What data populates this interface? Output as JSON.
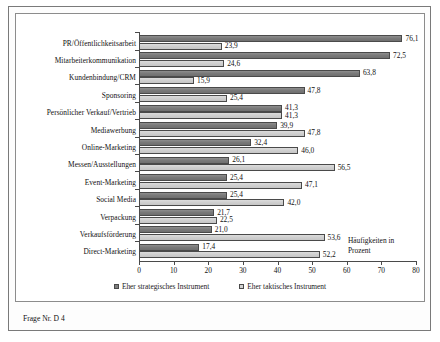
{
  "caption": "Frage Nr. D 4",
  "chart_data": {
    "type": "bar",
    "orientation": "horizontal",
    "title": "",
    "subtitle": "",
    "xlabel": "Häufigkeiten in Prozent",
    "ylabel": "",
    "xlim": [
      0,
      80
    ],
    "xticks": [
      0,
      10,
      20,
      30,
      40,
      50,
      60,
      70,
      80
    ],
    "xticklabels": [
      "0",
      "10",
      "20",
      "30",
      "40",
      "50",
      "60",
      "70",
      "80"
    ],
    "grid": false,
    "legend_position": "bottom-center",
    "value_label_decimal_separator": ",",
    "categories": [
      "PR/Öffentlichkeitsarbeit",
      "Mitarbeiterkommunikation",
      "Kundenbindung/CRM",
      "Sponsoring",
      "Persönlicher Verkauf/Vertrieb",
      "Mediawerbung",
      "Online-Marketing",
      "Messen/Ausstellungen",
      "Event-Marketing",
      "Social Media",
      "Verpackung",
      "Verkaufsförderung",
      "Direct-Marketing"
    ],
    "series": [
      {
        "name": "Eher strategisches Instrument",
        "color": "#7f7f7f",
        "values": [
          76.1,
          72.5,
          63.8,
          47.8,
          41.3,
          39.9,
          32.4,
          26.1,
          25.4,
          25.4,
          21.7,
          21.0,
          17.4
        ],
        "labels": [
          "76,1",
          "72,5",
          "63,8",
          "47,8",
          "41,3",
          "39,9",
          "32,4",
          "26,1",
          "25,4",
          "25,4",
          "21,7",
          "21,0",
          "17,4"
        ]
      },
      {
        "name": "Eher taktisches Instrument",
        "color": "#d2d2d2",
        "values": [
          23.9,
          24.6,
          15.9,
          25.4,
          41.3,
          47.8,
          46.0,
          56.5,
          47.1,
          42.0,
          22.5,
          53.6,
          52.2
        ],
        "labels": [
          "23,9",
          "24,6",
          "15,9",
          "25,4",
          "41,3",
          "47,8",
          "46,0",
          "56,5",
          "47,1",
          "42,0",
          "22,5",
          "53,6",
          "52,2"
        ]
      }
    ]
  }
}
